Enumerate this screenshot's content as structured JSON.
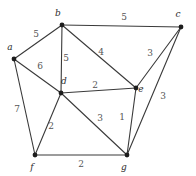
{
  "diagram": {
    "type": "node-link-graph",
    "background_color": "#ffffff",
    "edge_color": "#3a3a3a",
    "vertex_color": "#1d1d1d",
    "label_color": "#2b2b2b",
    "weight_color": "#555555",
    "vertices": [
      {
        "id": "a",
        "label": "a",
        "x": 14,
        "y": 59,
        "label_x": 10,
        "label_y": 50
      },
      {
        "id": "b",
        "label": "b",
        "x": 62,
        "y": 25,
        "label_x": 58,
        "label_y": 16
      },
      {
        "id": "c",
        "label": "c",
        "x": 181,
        "y": 27,
        "label_x": 178,
        "label_y": 17
      },
      {
        "id": "d",
        "label": "d",
        "x": 61,
        "y": 93,
        "label_x": 64,
        "label_y": 84
      },
      {
        "id": "e",
        "label": "e",
        "x": 136,
        "y": 88,
        "label_x": 141,
        "label_y": 92
      },
      {
        "id": "f",
        "label": "f",
        "x": 35,
        "y": 155,
        "label_x": 32,
        "label_y": 170
      },
      {
        "id": "g",
        "label": "g",
        "x": 127,
        "y": 155,
        "label_x": 124,
        "label_y": 170
      }
    ],
    "edges": [
      {
        "id": "edge-a-b",
        "from": "a",
        "to": "b",
        "weight": "5",
        "weight_x": 36,
        "weight_y": 37
      },
      {
        "id": "edge-b-c",
        "from": "b",
        "to": "c",
        "weight": "5",
        "weight_x": 124,
        "weight_y": 20
      },
      {
        "id": "edge-a-d",
        "from": "a",
        "to": "d",
        "weight": "6",
        "weight_x": 40,
        "weight_y": 69
      },
      {
        "id": "edge-b-d",
        "from": "b",
        "to": "d",
        "weight": "5",
        "weight_x": 66,
        "weight_y": 61
      },
      {
        "id": "edge-b-e",
        "from": "b",
        "to": "e",
        "weight": "4",
        "weight_x": 101,
        "weight_y": 55
      },
      {
        "id": "edge-c-e",
        "from": "c",
        "to": "e",
        "weight": "3",
        "weight_x": 150,
        "weight_y": 56
      },
      {
        "id": "edge-c-g",
        "from": "c",
        "to": "g",
        "weight": "3",
        "weight_x": 163,
        "weight_y": 99
      },
      {
        "id": "edge-d-e",
        "from": "d",
        "to": "e",
        "weight": "2",
        "weight_x": 95,
        "weight_y": 88
      },
      {
        "id": "edge-a-f",
        "from": "a",
        "to": "f",
        "weight": "7",
        "weight_x": 17,
        "weight_y": 112
      },
      {
        "id": "edge-d-f",
        "from": "d",
        "to": "f",
        "weight": "2",
        "weight_x": 51,
        "weight_y": 129
      },
      {
        "id": "edge-d-g",
        "from": "d",
        "to": "g",
        "weight": "3",
        "weight_x": 100,
        "weight_y": 121
      },
      {
        "id": "edge-e-g",
        "from": "e",
        "to": "g",
        "weight": "1",
        "weight_x": 122,
        "weight_y": 120
      },
      {
        "id": "edge-f-g",
        "from": "f",
        "to": "g",
        "weight": "2",
        "weight_x": 81,
        "weight_y": 167
      }
    ]
  }
}
